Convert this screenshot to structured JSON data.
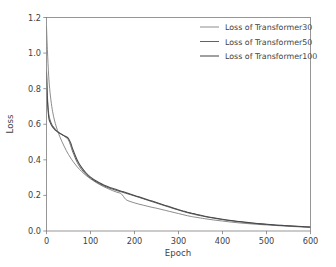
{
  "chart_data": {
    "type": "line",
    "title": "",
    "xlabel": "Epoch",
    "ylabel": "Loss",
    "xlim": [
      0,
      600
    ],
    "ylim": [
      0.0,
      1.2
    ],
    "xticks": [
      0,
      100,
      200,
      300,
      400,
      500,
      600
    ],
    "xtick_labels": [
      "0",
      "100",
      "200",
      "300",
      "400",
      "500",
      "600"
    ],
    "yticks": [
      0.0,
      0.2,
      0.4,
      0.6,
      0.8,
      1.0,
      1.2
    ],
    "ytick_labels": [
      "0.0",
      "0.2",
      "0.4",
      "0.6",
      "0.8",
      "1.0",
      "1.2"
    ],
    "grid": false,
    "legend_position": "upper right",
    "legend_frame": false,
    "x": [
      0,
      2,
      5,
      8,
      12,
      16,
      20,
      25,
      30,
      35,
      40,
      45,
      50,
      55,
      60,
      70,
      80,
      90,
      100,
      110,
      120,
      130,
      140,
      150,
      160,
      170,
      180,
      190,
      200,
      210,
      220,
      230,
      240,
      250,
      260,
      270,
      280,
      290,
      300,
      310,
      320,
      330,
      340,
      360,
      380,
      400,
      420,
      440,
      460,
      480,
      500,
      520,
      540,
      560,
      580,
      600
    ],
    "series": [
      {
        "name": "Loss of Transformer30",
        "color": "#6e6e6e",
        "linewidth": 0.8,
        "values": [
          1.15,
          1.02,
          0.87,
          0.78,
          0.7,
          0.645,
          0.605,
          0.565,
          0.532,
          0.503,
          0.477,
          0.452,
          0.43,
          0.41,
          0.392,
          0.36,
          0.334,
          0.312,
          0.293,
          0.277,
          0.262,
          0.249,
          0.238,
          0.227,
          0.218,
          0.209,
          0.178,
          0.166,
          0.158,
          0.151,
          0.145,
          0.139,
          0.133,
          0.128,
          0.122,
          0.116,
          0.11,
          0.104,
          0.098,
          0.092,
          0.086,
          0.081,
          0.077,
          0.069,
          0.062,
          0.056,
          0.05,
          0.045,
          0.041,
          0.037,
          0.034,
          0.031,
          0.028,
          0.025,
          0.023,
          0.021
        ]
      },
      {
        "name": "Loss of Transformer50",
        "color": "#5a5a5a",
        "linewidth": 0.95,
        "values": [
          0.905,
          0.76,
          0.66,
          0.625,
          0.6,
          0.585,
          0.572,
          0.56,
          0.55,
          0.542,
          0.534,
          0.525,
          0.512,
          0.48,
          0.443,
          0.385,
          0.345,
          0.318,
          0.297,
          0.28,
          0.266,
          0.254,
          0.244,
          0.235,
          0.227,
          0.22,
          0.212,
          0.205,
          0.197,
          0.189,
          0.181,
          0.173,
          0.165,
          0.157,
          0.149,
          0.141,
          0.133,
          0.125,
          0.118,
          0.11,
          0.103,
          0.097,
          0.091,
          0.081,
          0.072,
          0.064,
          0.057,
          0.051,
          0.046,
          0.041,
          0.037,
          0.033,
          0.03,
          0.027,
          0.024,
          0.021
        ]
      },
      {
        "name": "Loss of Transformer100",
        "color": "#4a4a4a",
        "linewidth": 1.05,
        "values": [
          0.89,
          0.735,
          0.64,
          0.612,
          0.592,
          0.578,
          0.567,
          0.557,
          0.549,
          0.542,
          0.536,
          0.53,
          0.52,
          0.495,
          0.458,
          0.398,
          0.356,
          0.326,
          0.303,
          0.285,
          0.271,
          0.259,
          0.249,
          0.24,
          0.232,
          0.224,
          0.216,
          0.208,
          0.2,
          0.192,
          0.184,
          0.176,
          0.168,
          0.16,
          0.152,
          0.144,
          0.136,
          0.128,
          0.12,
          0.113,
          0.106,
          0.1,
          0.094,
          0.083,
          0.074,
          0.066,
          0.059,
          0.053,
          0.047,
          0.042,
          0.038,
          0.034,
          0.031,
          0.028,
          0.025,
          0.022
        ]
      }
    ]
  },
  "figure": {
    "background": "#ffffff",
    "frame_color": "#7d7d7d"
  }
}
